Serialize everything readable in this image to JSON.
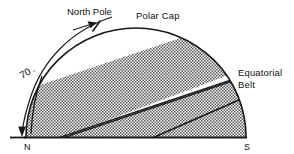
{
  "figure": {
    "type": "diagram",
    "labels": {
      "north_pole": "North Pole",
      "polar_cap": "Polar Cap",
      "equatorial_belt_line1": "Equatorial",
      "equatorial_belt_line2": "Belt",
      "angle_value": "70",
      "angle_unit": "°",
      "pole_n": "N",
      "pole_s": "S"
    },
    "colors": {
      "ink": "#1a1a1a",
      "background": "#ffffff",
      "hatch": "#4d4d4d"
    },
    "geometry": {
      "baseline_y": 137,
      "dome_left_x": 26,
      "dome_right_x": 246,
      "dome_apex_y": 28,
      "angle_label_degrees": 70
    },
    "regions": [
      {
        "name": "polar-cap-band",
        "filled": true
      },
      {
        "name": "white-gap-band",
        "filled": false
      },
      {
        "name": "equatorial-belt-band",
        "filled": true
      }
    ]
  }
}
